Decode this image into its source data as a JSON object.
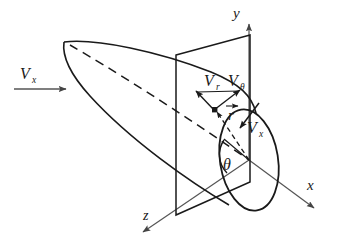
{
  "figure": {
    "background_color": "#ffffff",
    "line_color": "#1a1a1a",
    "axis_color": "#555555"
  },
  "axes": [
    {
      "name": "y-axis",
      "label": "y",
      "direction": "up",
      "label_x": 233,
      "label_y": 18
    },
    {
      "name": "x-axis",
      "label": "x",
      "direction": "down-right",
      "label_x": 310,
      "label_y": 190
    },
    {
      "name": "z-axis",
      "label": "z",
      "direction": "down-left",
      "label_x": 146,
      "label_y": 220
    }
  ],
  "vectors": [
    {
      "name": "freestream-velocity",
      "base": "V",
      "subscript": "x",
      "label_x": 22,
      "label_y": 78,
      "arrow": "horizontal-right"
    },
    {
      "name": "radial-velocity",
      "base": "V",
      "subscript": "r",
      "label_x": 205,
      "label_y": 85,
      "arrow": "up-left"
    },
    {
      "name": "tangential-velocity",
      "base": "V",
      "subscript": "θ",
      "label_x": 233,
      "label_y": 85,
      "arrow": "up-right"
    },
    {
      "name": "axial-velocity",
      "base": "V",
      "subscript": "x",
      "label_x": 248,
      "label_y": 130,
      "arrow": "down-left"
    },
    {
      "name": "radius-vector",
      "base": "r",
      "subscript": "",
      "label_x": 229,
      "label_y": 116,
      "arrow": "overbar-vector"
    }
  ],
  "angle": {
    "name": "theta-angle",
    "label": "θ",
    "label_x": 228,
    "label_y": 168
  },
  "shapes": {
    "body": "ogive body of revolution",
    "plane": "vertical cross-flow parallelogram plane",
    "disk": "circular cross-section ellipse",
    "centerline": "dashed axis of revolution"
  }
}
